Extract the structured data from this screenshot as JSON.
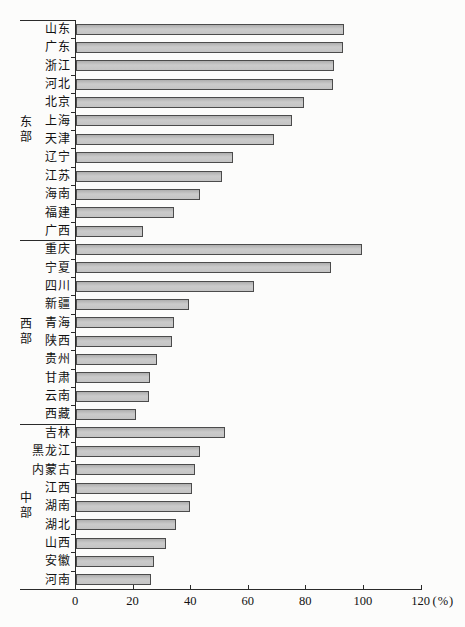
{
  "chart_data": {
    "type": "bar",
    "orientation": "horizontal",
    "title": "",
    "xlabel": "",
    "ylabel": "",
    "unit_label": "(%)",
    "xlim": [
      0,
      120
    ],
    "x_ticks": [
      0,
      20,
      40,
      60,
      80,
      100,
      120
    ],
    "grid": false,
    "legend": "none",
    "bar_fill_color": "#c4c4c4",
    "bar_border_color": "#4b4b4b",
    "axis_color": "#2a2a2a",
    "groups": [
      {
        "name": "东部",
        "items": [
          {
            "label": "山东",
            "value": 92.5
          },
          {
            "label": "广东",
            "value": 92
          },
          {
            "label": "浙江",
            "value": 89
          },
          {
            "label": "河北",
            "value": 88.5
          },
          {
            "label": "北京",
            "value": 78.5
          },
          {
            "label": "上海",
            "value": 74.5
          },
          {
            "label": "天津",
            "value": 68
          },
          {
            "label": "辽宁",
            "value": 54
          },
          {
            "label": "江苏",
            "value": 50
          },
          {
            "label": "海南",
            "value": 42.5
          },
          {
            "label": "福建",
            "value": 33.5
          },
          {
            "label": "广西",
            "value": 22.5
          }
        ]
      },
      {
        "name": "西部",
        "items": [
          {
            "label": "重庆",
            "value": 98.5
          },
          {
            "label": "宁夏",
            "value": 88
          },
          {
            "label": "四川",
            "value": 61
          },
          {
            "label": "新疆",
            "value": 38.5
          },
          {
            "label": "青海",
            "value": 33.5
          },
          {
            "label": "陕西",
            "value": 32.5
          },
          {
            "label": "贵州",
            "value": 27.5
          },
          {
            "label": "甘肃",
            "value": 25
          },
          {
            "label": "云南",
            "value": 24.5
          },
          {
            "label": "西藏",
            "value": 20
          }
        ]
      },
      {
        "name": "中部",
        "items": [
          {
            "label": "吉林",
            "value": 51
          },
          {
            "label": "黑龙江",
            "value": 42.5
          },
          {
            "label": "内蒙古",
            "value": 40.5
          },
          {
            "label": "江西",
            "value": 39.5
          },
          {
            "label": "湖南",
            "value": 39
          },
          {
            "label": "湖北",
            "value": 34
          },
          {
            "label": "山西",
            "value": 30.5
          },
          {
            "label": "安徽",
            "value": 26.5
          },
          {
            "label": "河南",
            "value": 25.5
          }
        ]
      }
    ]
  }
}
